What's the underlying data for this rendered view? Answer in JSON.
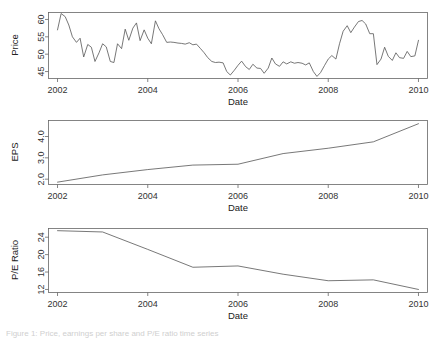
{
  "figure": {
    "background_color": "#ffffff",
    "line_color": "#555555",
    "axis_color": "#666666",
    "caption_partial": "Figure 1: Price, earnings per share and P/E ratio time series"
  },
  "panels": [
    {
      "id": "price",
      "ylabel": "Price",
      "xlabel": "Date"
    },
    {
      "id": "eps",
      "ylabel": "EPS",
      "xlabel": "Date"
    },
    {
      "id": "pe",
      "ylabel": "P/E Ratio",
      "xlabel": "Date"
    }
  ],
  "chart_data": [
    {
      "type": "line",
      "title": "",
      "xlabel": "Date",
      "ylabel": "Price",
      "xlim": [
        2001.8,
        2010.2
      ],
      "ylim": [
        43.0,
        62.0
      ],
      "xticks": [
        2002,
        2004,
        2006,
        2008,
        2010
      ],
      "xtick_labels": [
        "2002",
        "2004",
        "2006",
        "2008",
        "2010"
      ],
      "yticks": [
        45,
        50,
        55,
        60
      ],
      "ytick_labels": [
        "45",
        "50",
        "55",
        "60"
      ],
      "grid": false,
      "legend": "none",
      "series": [
        {
          "name": "Price",
          "x": [
            2002.0,
            2002.08,
            2002.17,
            2002.25,
            2002.33,
            2002.42,
            2002.5,
            2002.58,
            2002.67,
            2002.75,
            2002.83,
            2002.92,
            2003.0,
            2003.08,
            2003.17,
            2003.25,
            2003.33,
            2003.42,
            2003.5,
            2003.58,
            2003.67,
            2003.75,
            2003.83,
            2003.92,
            2004.0,
            2004.08,
            2004.17,
            2004.25,
            2004.33,
            2004.42,
            2004.5,
            2004.58,
            2004.67,
            2004.75,
            2004.83,
            2004.92,
            2005.0,
            2005.08,
            2005.17,
            2005.25,
            2005.33,
            2005.42,
            2005.5,
            2005.58,
            2005.67,
            2005.75,
            2005.83,
            2005.92,
            2006.0,
            2006.08,
            2006.17,
            2006.25,
            2006.33,
            2006.42,
            2006.5,
            2006.58,
            2006.67,
            2006.75,
            2006.83,
            2006.92,
            2007.0,
            2007.08,
            2007.17,
            2007.25,
            2007.33,
            2007.42,
            2007.5,
            2007.58,
            2007.67,
            2007.75,
            2007.83,
            2007.92,
            2008.0,
            2008.08,
            2008.17,
            2008.25,
            2008.33,
            2008.42,
            2008.5,
            2008.58,
            2008.67,
            2008.75,
            2008.83,
            2008.92,
            2009.0,
            2009.08,
            2009.17,
            2009.25,
            2009.33,
            2009.42,
            2009.5,
            2009.58,
            2009.67,
            2009.75,
            2009.83,
            2009.92,
            2010.0
          ],
          "values": [
            57.0,
            61.7,
            60.8,
            58.4,
            55.0,
            53.4,
            54.6,
            49.2,
            52.8,
            52.0,
            47.9,
            50.4,
            53.0,
            52.1,
            47.9,
            47.6,
            53.0,
            51.6,
            57.2,
            54.0,
            57.5,
            59.0,
            53.9,
            57.0,
            54.6,
            53.0,
            59.6,
            57.3,
            55.6,
            53.4,
            53.5,
            53.4,
            53.2,
            53.1,
            52.9,
            53.3,
            52.7,
            52.9,
            51.6,
            50.4,
            49.0,
            47.9,
            47.6,
            47.7,
            47.5,
            45.0,
            44.0,
            45.4,
            46.8,
            48.0,
            46.4,
            45.6,
            47.1,
            46.0,
            45.9,
            44.5,
            46.0,
            48.9,
            47.2,
            46.5,
            47.8,
            47.2,
            47.8,
            47.4,
            47.6,
            47.4,
            46.9,
            47.5,
            45.0,
            43.6,
            44.7,
            46.8,
            48.6,
            49.6,
            48.6,
            53.0,
            56.6,
            58.2,
            56.2,
            57.8,
            59.4,
            59.7,
            58.7,
            55.9,
            55.9,
            47.0,
            48.6,
            52.0,
            49.4,
            48.2,
            50.4,
            49.0,
            48.8,
            50.8,
            49.3,
            49.5,
            54.0
          ]
        }
      ]
    },
    {
      "type": "line",
      "title": "",
      "xlabel": "Date",
      "ylabel": "EPS",
      "xlim": [
        2001.8,
        2010.2
      ],
      "ylim": [
        1.75,
        4.75
      ],
      "xticks": [
        2002,
        2004,
        2006,
        2008,
        2010
      ],
      "xtick_labels": [
        "2002",
        "2004",
        "2006",
        "2008",
        "2010"
      ],
      "yticks": [
        2.0,
        3.0,
        4.0
      ],
      "ytick_labels": [
        "2.0",
        "3.0",
        "4.0"
      ],
      "grid": false,
      "legend": "none",
      "series": [
        {
          "name": "EPS",
          "x": [
            2002,
            2003,
            2004,
            2005,
            2006,
            2007,
            2008,
            2009,
            2010
          ],
          "values": [
            1.86,
            2.2,
            2.45,
            2.66,
            2.7,
            3.2,
            3.45,
            3.75,
            4.6
          ]
        }
      ]
    },
    {
      "type": "line",
      "title": "",
      "xlabel": "Date",
      "ylabel": "P/E Ratio",
      "xlim": [
        2001.8,
        2010.2
      ],
      "ylim": [
        11.3,
        26.0
      ],
      "xticks": [
        2002,
        2004,
        2006,
        2008,
        2010
      ],
      "xtick_labels": [
        "2002",
        "2004",
        "2006",
        "2008",
        "2010"
      ],
      "yticks": [
        12,
        16,
        20,
        24
      ],
      "ytick_labels": [
        "12",
        "16",
        "20",
        "24"
      ],
      "grid": false,
      "legend": "none",
      "series": [
        {
          "name": "P/E Ratio",
          "x": [
            2002,
            2003,
            2004,
            2005,
            2006,
            2007,
            2008,
            2009,
            2010
          ],
          "values": [
            25.5,
            25.2,
            21.2,
            17.1,
            17.4,
            15.5,
            14.0,
            14.2,
            12.0
          ]
        }
      ]
    }
  ]
}
